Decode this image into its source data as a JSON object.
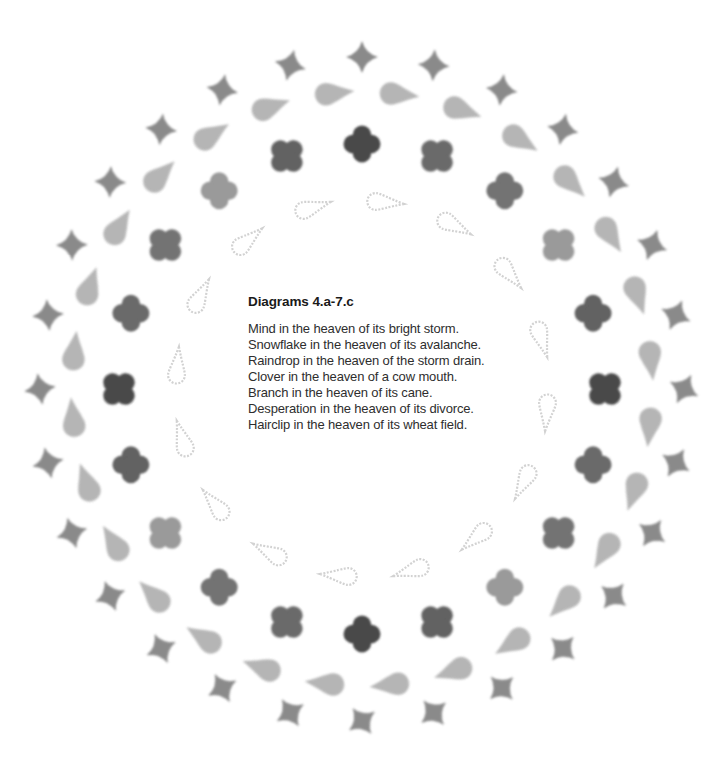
{
  "caption": {
    "title": "Diagrams 4.a-7.c",
    "lines": [
      "Mind in the heaven of its bright storm.",
      "Snowflake in the heaven of its avalanche.",
      "Raindrop in the heaven of the storm drain.",
      "Clover in the heaven of a cow mouth.",
      "Branch in the heaven of its cane.",
      "Desperation in the heaven of its divorce.",
      "Hairclip in the heaven of its wheat field."
    ]
  },
  "diagram": {
    "center": [
      362,
      389
    ],
    "rings": [
      {
        "name": "sparkle-ring",
        "shape": "sparkle-icon",
        "count": 28,
        "rx": 322,
        "ry": 332,
        "offset_deg": 0,
        "color": "#8a8a8a",
        "size": 16
      },
      {
        "name": "teardrop-ring",
        "shape": "teardrop-icon",
        "count": 28,
        "rx": 290,
        "ry": 297,
        "offset_deg": 6.4,
        "color": "#a9a9a9",
        "size": 18
      },
      {
        "name": "cross-ring",
        "shape": "quatrefoil-icon",
        "count": 20,
        "rx": 243,
        "ry": 245,
        "offset_deg": 0,
        "colors": [
          "#4a4a4a",
          "#6a6a6a",
          "#737373",
          "#9a9a9a",
          "#626262"
        ],
        "size": 22
      },
      {
        "name": "outline-teardrop-ring",
        "shape": "outline-teardrop-icon",
        "count": 16,
        "rx": 186,
        "ry": 188,
        "offset_deg": 5,
        "color": "#d2d2d2",
        "size": 20
      }
    ]
  }
}
